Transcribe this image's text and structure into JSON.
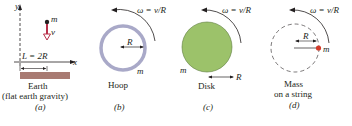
{
  "panels": [
    {
      "id": "a",
      "caption_letter": "(a)",
      "title_line1": "Earth",
      "title_line2": "(flat earth gravity)",
      "axis_y": "y",
      "axis_x": "x",
      "mass_label": "m",
      "velocity_label": "v",
      "length_label": "L = 2R"
    },
    {
      "id": "b",
      "caption_letter": "(b)",
      "title": "Hoop",
      "omega_label": "ω = v/R",
      "radius_label": "R",
      "mass_label": "m"
    },
    {
      "id": "c",
      "caption_letter": "(c)",
      "title": "Disk",
      "omega_label": "ω = v/R",
      "radius_label": "R",
      "mass_label": "m"
    },
    {
      "id": "d",
      "caption_letter": "(d)",
      "title_line1": "Mass",
      "title_line2": "on a string",
      "omega_label": "ω = v/R",
      "radius_label": "R",
      "mass_label": "m"
    }
  ],
  "colors": {
    "ground": "#a87a72",
    "velocity_arrow": "#b8304a",
    "hoop": "#a9a9c8",
    "disk": "#9cc26a",
    "mass_dot": "#d23a2a",
    "ink": "#231f20"
  }
}
